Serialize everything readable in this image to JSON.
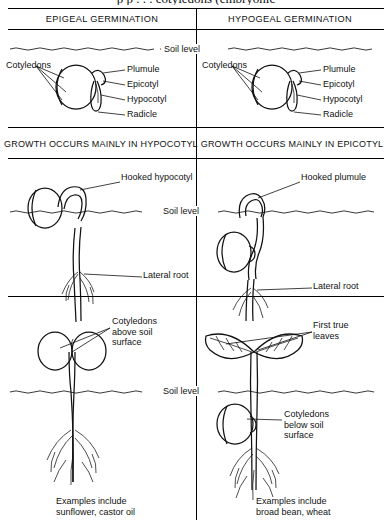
{
  "figure": {
    "cutoff_title": "p                p                 . . .  cotyledons  (embryonic",
    "columns": [
      {
        "id": "epigeal",
        "header": "EPIGEAL GERMINATION"
      },
      {
        "id": "hypogeal",
        "header": "HYPOGEAL GERMINATION"
      }
    ],
    "soil_level_label": "Soil level"
  },
  "stage1": {
    "labels": {
      "cotyledons": "Cotyledons",
      "plumule": "Plumule",
      "epicotyl": "Epicotyl",
      "hypocotyl": "Hypocotyl",
      "radicle": "Radicle"
    }
  },
  "growth_band": {
    "left": "GROWTH OCCURS MAINLY IN HYPOCOTYL",
    "right": "GROWTH OCCURS MAINLY IN EPICOTYL"
  },
  "stage2": {
    "left": {
      "hook_label": "Hooked hypocotyl",
      "lateral_root": "Lateral root"
    },
    "right": {
      "hook_label": "Hooked plumule",
      "lateral_root": "Lateral root"
    }
  },
  "stage3": {
    "left": {
      "cotyledons_note": "Cotyledons\nabove soil\nsurface"
    },
    "right": {
      "first_true_leaves": "First true\nleaves",
      "cotyledons_note": "Cotyledons\nbelow\nsoil\nsurface"
    }
  },
  "examples": {
    "left": "Examples include\nsunflower, castor oil",
    "right": "Examples include\nbroad bean, wheat"
  },
  "colors": {
    "ink": "#111111",
    "paper": "#ffffff"
  }
}
